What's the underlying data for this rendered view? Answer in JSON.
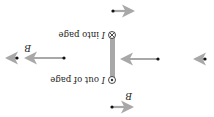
{
  "diagram": {
    "orientation_note": "rendered rotated 180 degrees",
    "wire": {
      "top_label": "I into page",
      "bottom_label": "I out of page",
      "current_symbol_label": "I",
      "top_text": " into page",
      "bottom_text": " out of page",
      "color": "#a8a8a8"
    },
    "field_label": "B",
    "arrow_color": "#a8a8a8",
    "dot_color": "#111111"
  }
}
